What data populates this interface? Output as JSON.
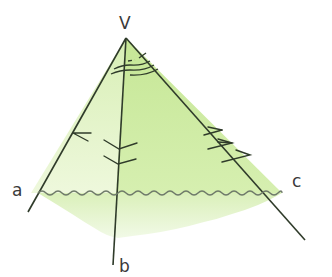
{
  "diagram": {
    "vertex": {
      "label": "V"
    },
    "edges": [
      {
        "label": "a"
      },
      {
        "label": "b"
      },
      {
        "label": "c"
      }
    ],
    "angle_marks": {
      "face_ab": "double arc",
      "face_bc": "triple arc",
      "face_ac": "dashed arc"
    },
    "arrow_marks": {
      "face_ab_left": 1,
      "edge_b": 2,
      "face_bc_right": 3
    },
    "colors": {
      "line": "#2f3b2a",
      "face_light": "#e4f3c8",
      "face_mid": "#d3ecaa",
      "face_right": "#c8e89a",
      "wave": "#6f7a6a"
    }
  }
}
